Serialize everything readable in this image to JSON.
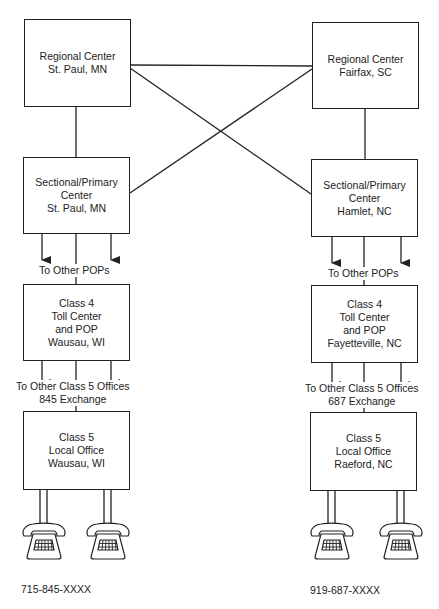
{
  "left": {
    "regional": {
      "line1": "Regional Center",
      "line2": "St. Paul, MN"
    },
    "sectional": {
      "line1": "Sectional/Primary",
      "line2": "Center",
      "line3": "St. Paul, MN"
    },
    "pops_label": "To Other POPs",
    "class4": {
      "line1": "Class 4",
      "line2": "Toll Center",
      "line3": "and POP",
      "line4": "Wausau, WI"
    },
    "class5_label": {
      "line1": "To Other Class 5 Offices",
      "line2": "845 Exchange"
    },
    "class5": {
      "line1": "Class 5",
      "line2": "Local Office",
      "line3": "Wausau, WI"
    },
    "phone_number": "715-845-XXXX"
  },
  "right": {
    "regional": {
      "line1": "Regional Center",
      "line2": "Fairfax, SC"
    },
    "sectional": {
      "line1": "Sectional/Primary",
      "line2": "Center",
      "line3": "Hamlet, NC"
    },
    "pops_label": "To Other POPs",
    "class4": {
      "line1": "Class 4",
      "line2": "Toll Center",
      "line3": "and POP",
      "line4": "Fayetteville, NC"
    },
    "class5_label": {
      "line1": "To Other Class 5 Offices",
      "line2": "687 Exchange"
    },
    "class5": {
      "line1": "Class 5",
      "line2": "Local Office",
      "line3": "Raeford, NC"
    },
    "phone_number": "919-687-XXXX"
  },
  "icons": {
    "telephone": "telephone-icon",
    "arrow": "arrow-down-icon"
  },
  "colors": {
    "line": "#222222",
    "background": "#ffffff"
  }
}
